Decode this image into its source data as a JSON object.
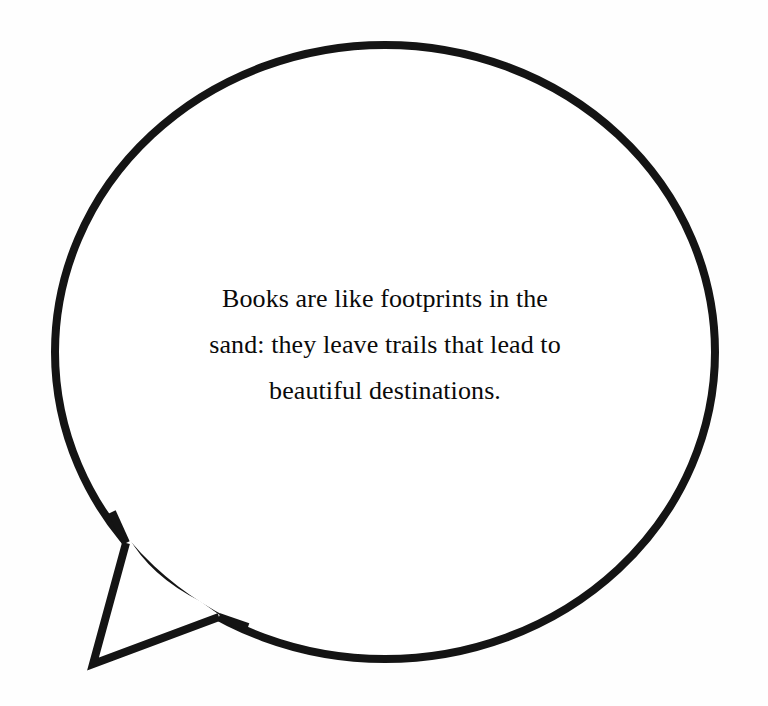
{
  "canvas": {
    "width": 768,
    "height": 706,
    "background_color": "#fefefe"
  },
  "speech_bubble": {
    "shape": "ellipse-with-angular-tail",
    "fill_color": "#ffffff",
    "stroke_color": "#141414",
    "stroke_width": 8,
    "ellipse": {
      "center_x": 385,
      "center_y": 352,
      "radius_x": 330,
      "radius_y": 307
    },
    "tail": {
      "direction": "down-left",
      "notch_point": "127,545",
      "tip_point": "93,664",
      "rejoin_point": "218,618"
    }
  },
  "quote": {
    "full_text": "Books are like footprints in the sand: they leave trails that lead to beautiful destinations.",
    "text_color": "#0a0a0a",
    "alignment": "center",
    "lines": [
      "Books are like footprints in the",
      "sand: they leave trails that lead to",
      "beautiful destinations."
    ]
  }
}
